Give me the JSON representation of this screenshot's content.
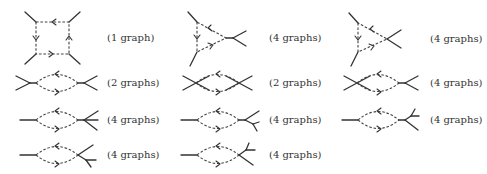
{
  "diagram": {
    "labels": {
      "r1c1": "(1 graph)",
      "r1c2": "(4 graphs)",
      "r1c3": "(4 graphs)",
      "r2c1": "(2 graphs)",
      "r2c2": "(2 graphs)",
      "r2c3": "(4 graphs)",
      "r3c1": "(4 graphs)",
      "r3c2": "(4 graphs)",
      "r3c3": "(4 graphs)",
      "r4c1": "(4 graphs)",
      "r4c2": "(4 graphs)"
    },
    "colors": {
      "line": "#333333",
      "background": "#ffffff"
    }
  }
}
